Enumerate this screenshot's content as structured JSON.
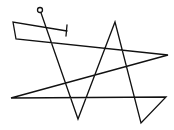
{
  "diagram": {
    "background": "#ffffff",
    "stroke_color": "#111111",
    "stroke_width": 1.3,
    "start_marker": {
      "cx": 40,
      "cy": 10,
      "r": 2.5
    },
    "path_points": [
      [
        40,
        10
      ],
      [
        78,
        119
      ],
      [
        115,
        22
      ],
      [
        141,
        123
      ],
      [
        166,
        97
      ],
      [
        11,
        98
      ],
      [
        168,
        55
      ],
      [
        16,
        39
      ],
      [
        13,
        22
      ],
      [
        67,
        31
      ]
    ],
    "end_tick": {
      "x1": 67,
      "y1": 25,
      "x2": 66,
      "y2": 36
    }
  }
}
